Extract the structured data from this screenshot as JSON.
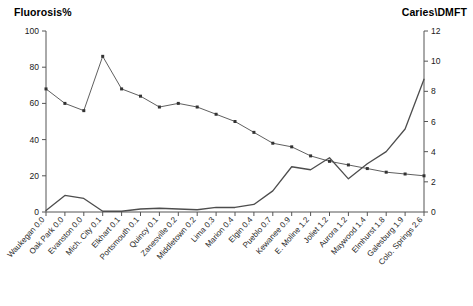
{
  "chart": {
    "left_axis_title": "Fluorosis%",
    "right_axis_title": "Caries\\DMFT"
  },
  "chart_data": {
    "type": "line",
    "title": "",
    "xlabel": "",
    "ylabel": "Fluorosis%",
    "y2label": "Caries\\DMFT",
    "ylim": [
      0,
      100
    ],
    "y2lim": [
      0,
      12
    ],
    "yticks": [
      0,
      20,
      40,
      60,
      80,
      100
    ],
    "y2ticks": [
      0,
      2,
      4,
      6,
      8,
      10,
      12
    ],
    "grid": false,
    "legend": "none",
    "categories": [
      "Waukegan 0.0",
      "Oak Park 0.0",
      "Evanston 0.0",
      "Mich. City 0.1",
      "Elkhart 0.1",
      "Portsmouth 0.1",
      "Quincy 0.1",
      "Zanesville 0.2",
      "Middletown 0.2",
      "Lima 0.3",
      "Marion 0.4",
      "Elgin 0.4",
      "Pueblo 0.7",
      "Kewanee 0.9",
      "E. Moline 1.2",
      "Joliet 1.2",
      "Aurora 1.2",
      "Maywood 1.4",
      "Elmhurst 1.8",
      "Galesburg 1.9",
      "Colo. Springs 2.6"
    ],
    "series": [
      {
        "name": "Caries\\DMFT",
        "axis": "right",
        "markers": false,
        "color": "#4d4d4d",
        "values": [
          0.1,
          1.1,
          0.9,
          0.05,
          0.05,
          0.2,
          0.25,
          0.2,
          0.15,
          0.3,
          0.3,
          0.5,
          1.4,
          3.0,
          2.8,
          3.6,
          2.2,
          3.2,
          4.0,
          5.5,
          8.8
        ]
      },
      {
        "name": "Fluorosis%",
        "axis": "left",
        "markers": true,
        "color": "#4d4d4d",
        "values": [
          68,
          60,
          56,
          86,
          68,
          64,
          58,
          60,
          58,
          54,
          50,
          44,
          38,
          36,
          31,
          28,
          26,
          24,
          22,
          21,
          20
        ]
      }
    ]
  }
}
